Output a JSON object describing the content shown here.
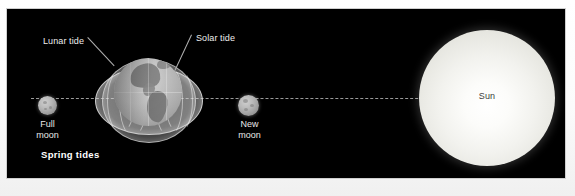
{
  "figure": {
    "title": "Spring tides",
    "background_color": "#000000",
    "mat_color": "#f4f4f4"
  },
  "callouts": [
    {
      "id": "lunar-tide",
      "label": "Lunar tide"
    },
    {
      "id": "solar-tide",
      "label": "Solar tide"
    }
  ],
  "bodies": {
    "full_moon": {
      "label_line1": "Full",
      "label_line2": "moon",
      "color": "#b0b0b0"
    },
    "new_moon": {
      "label_line1": "New",
      "label_line2": "moon",
      "color": "#a8a8a8"
    },
    "sun": {
      "label": "Sun",
      "color": "#f4f4ee"
    },
    "earth": {
      "label": ""
    }
  },
  "caption": {
    "text": "Spring tides"
  },
  "colors": {
    "sky": "#000000",
    "label_text": "#eeeeee",
    "sun_label_text": "#3c3c3c",
    "leader_line": "#b0b0b0",
    "axis_line": "#9a9a9a"
  }
}
